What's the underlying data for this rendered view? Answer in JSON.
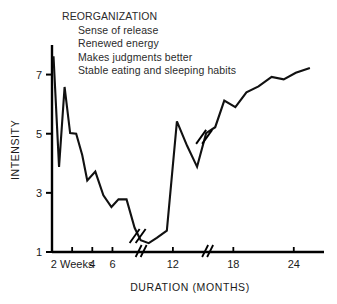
{
  "annotation": {
    "title": "REORGANIZATION",
    "items": [
      "Sense of release",
      "Renewed energy",
      "Makes judgments better",
      "Stable eating and sleeping habits"
    ]
  },
  "chart_data": {
    "type": "line",
    "title": "",
    "xlabel": "DURATION (MONTHS)",
    "ylabel": "INTENSITY",
    "xlim": [
      0,
      27
    ],
    "ylim": [
      1,
      8
    ],
    "grid": false,
    "legend": null,
    "line_color": "#111111",
    "axis_color": "#000000",
    "xticks": [
      2,
      4,
      6,
      12,
      18,
      24
    ],
    "xticklabels": [
      "2 Weeks",
      "4",
      "6",
      "12",
      "18",
      "24"
    ],
    "yticks": [
      1,
      3,
      5,
      7
    ],
    "yticklabels": [
      "1",
      "3",
      "5",
      "7"
    ],
    "axis_breaks_x": [
      8.6,
      15.2
    ],
    "line_breaks_x": [
      8.6,
      15.2
    ],
    "annotations": [
      "REORGANIZATION",
      "Sense of release",
      "Renewed energy",
      "Makes judgments better",
      "Stable eating and sleeping habits"
    ],
    "x": [
      0.15,
      0.7,
      1.25,
      1.8,
      2.4,
      3.0,
      3.5,
      4.3,
      5.1,
      5.9,
      6.6,
      7.4,
      8.2,
      8.8,
      9.6,
      10.4,
      11.4,
      12.4,
      13.4,
      14.4,
      15.3,
      16.2,
      17.1,
      18.2,
      19.3,
      20.5,
      21.8,
      23.0,
      24.2,
      25.6
    ],
    "y": [
      7.62,
      3.88,
      6.58,
      5.02,
      5.0,
      4.28,
      3.42,
      3.72,
      2.92,
      2.52,
      2.78,
      2.78,
      1.82,
      1.4,
      1.3,
      1.48,
      1.72,
      5.42,
      4.6,
      3.88,
      5.02,
      5.22,
      6.12,
      5.9,
      6.4,
      6.6,
      6.92,
      6.84,
      7.06,
      7.22
    ],
    "series": [
      {
        "name": "Intensity over time",
        "points": [
          {
            "x": 0.15,
            "y": 7.62
          },
          {
            "x": 0.7,
            "y": 3.88
          },
          {
            "x": 1.25,
            "y": 6.58
          },
          {
            "x": 1.8,
            "y": 5.02
          },
          {
            "x": 2.4,
            "y": 5.0
          },
          {
            "x": 3.0,
            "y": 4.28
          },
          {
            "x": 3.5,
            "y": 3.42
          },
          {
            "x": 4.3,
            "y": 3.72
          },
          {
            "x": 5.1,
            "y": 2.92
          },
          {
            "x": 5.9,
            "y": 2.52
          },
          {
            "x": 6.6,
            "y": 2.78
          },
          {
            "x": 7.4,
            "y": 2.78
          },
          {
            "x": 8.2,
            "y": 1.82
          },
          {
            "x": 8.8,
            "y": 1.4
          },
          {
            "x": 9.6,
            "y": 1.3
          },
          {
            "x": 10.4,
            "y": 1.48
          },
          {
            "x": 11.4,
            "y": 1.72
          },
          {
            "x": 12.4,
            "y": 5.42
          },
          {
            "x": 13.4,
            "y": 4.6
          },
          {
            "x": 14.4,
            "y": 3.88
          },
          {
            "x": 15.3,
            "y": 5.02
          },
          {
            "x": 16.2,
            "y": 5.22
          },
          {
            "x": 17.1,
            "y": 6.12
          },
          {
            "x": 18.2,
            "y": 5.9
          },
          {
            "x": 19.3,
            "y": 6.4
          },
          {
            "x": 20.5,
            "y": 6.6
          },
          {
            "x": 21.8,
            "y": 6.92
          },
          {
            "x": 23.0,
            "y": 6.84
          },
          {
            "x": 24.2,
            "y": 7.06
          },
          {
            "x": 25.6,
            "y": 7.22
          }
        ]
      }
    ]
  }
}
